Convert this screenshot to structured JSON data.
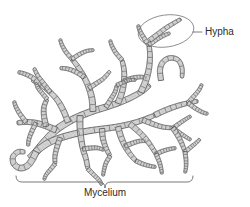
{
  "figure": {
    "background_color": "#ffffff",
    "width": 250,
    "height": 207
  },
  "labels": {
    "hypha": {
      "text": "Hypha",
      "x": 205,
      "y": 35,
      "anchor": "start",
      "color": "#2b2b2b",
      "font_size": 10
    },
    "mycelium": {
      "text": "Mycelium",
      "x": 105,
      "y": 196,
      "anchor": "middle",
      "color": "#2b2b2b",
      "font_size": 10
    }
  },
  "callout": {
    "name": "hypha-callout",
    "shape": "ellipse",
    "cx": 166,
    "cy": 31,
    "rx": 28,
    "ry": 16,
    "rotation": -8,
    "stroke_color": "#7a7a7a",
    "leader_from_x": 193,
    "leader_from_y": 32,
    "leader_to_x": 202,
    "leader_to_y": 32
  },
  "brace": {
    "name": "mycelium-brace",
    "left_x": 16,
    "right_x": 193,
    "top_y": 176,
    "baseline_y": 182,
    "notch_x": 105,
    "notch_y": 188,
    "stroke_color": "#6a6a6a"
  },
  "colors": {
    "hypha_fill": "#d4d4d4",
    "hypha_stipple": "#8e8e8e",
    "hypha_outline": "#5a5a5a",
    "septum": "#6a6a6a",
    "label": "#2b2b2b",
    "callout_stroke": "#7a7a7a",
    "background": "#ffffff"
  },
  "structure": {
    "description": "Branching network of septate hyphae forming a mycelium",
    "branch_count": 38,
    "septa_count": 96
  },
  "hyphae": [
    {
      "name": "trunk-main",
      "width": 7.0,
      "points": [
        [
          36,
          152
        ],
        [
          46,
          140
        ],
        [
          56,
          130
        ],
        [
          68,
          122
        ],
        [
          80,
          116
        ],
        [
          93,
          111
        ],
        [
          106,
          107
        ],
        [
          118,
          103
        ],
        [
          130,
          98
        ],
        [
          141,
          92
        ],
        [
          150,
          85
        ]
      ]
    },
    {
      "name": "trunk-lower",
      "width": 6.6,
      "points": [
        [
          30,
          158
        ],
        [
          38,
          150
        ],
        [
          48,
          143
        ],
        [
          60,
          138
        ],
        [
          74,
          134
        ],
        [
          88,
          131
        ],
        [
          102,
          129
        ],
        [
          116,
          127
        ],
        [
          130,
          124
        ],
        [
          143,
          120
        ],
        [
          155,
          115
        ]
      ]
    },
    {
      "name": "branch-upper-left",
      "width": 5.6,
      "points": [
        [
          68,
          122
        ],
        [
          64,
          112
        ],
        [
          58,
          101
        ],
        [
          50,
          92
        ],
        [
          41,
          85
        ],
        [
          32,
          80
        ]
      ]
    },
    {
      "name": "tip-upper-left-a",
      "width": 4.6,
      "points": [
        [
          41,
          85
        ],
        [
          33,
          78
        ],
        [
          25,
          74
        ],
        [
          18,
          72
        ]
      ]
    },
    {
      "name": "tip-upper-left-b",
      "width": 4.4,
      "points": [
        [
          50,
          92
        ],
        [
          44,
          84
        ],
        [
          38,
          76
        ],
        [
          34,
          68
        ]
      ]
    },
    {
      "name": "branch-up-center",
      "width": 6.0,
      "points": [
        [
          93,
          111
        ],
        [
          92,
          99
        ],
        [
          89,
          88
        ],
        [
          84,
          77
        ],
        [
          78,
          67
        ],
        [
          72,
          59
        ]
      ]
    },
    {
      "name": "tip-up-center-a",
      "width": 4.6,
      "points": [
        [
          84,
          77
        ],
        [
          76,
          72
        ],
        [
          68,
          69
        ],
        [
          60,
          68
        ]
      ]
    },
    {
      "name": "tip-up-center-b",
      "width": 4.4,
      "points": [
        [
          89,
          88
        ],
        [
          97,
          83
        ],
        [
          104,
          78
        ],
        [
          110,
          71
        ]
      ]
    },
    {
      "name": "tip-up-center-c",
      "width": 4.2,
      "points": [
        [
          72,
          59
        ],
        [
          66,
          52
        ],
        [
          62,
          45
        ],
        [
          60,
          39
        ]
      ]
    },
    {
      "name": "tip-up-center-d",
      "width": 4.0,
      "points": [
        [
          72,
          59
        ],
        [
          80,
          54
        ],
        [
          87,
          51
        ],
        [
          94,
          50
        ]
      ]
    },
    {
      "name": "branch-mid-right",
      "width": 5.8,
      "points": [
        [
          118,
          103
        ],
        [
          122,
          92
        ],
        [
          124,
          81
        ],
        [
          124,
          70
        ],
        [
          122,
          60
        ]
      ]
    },
    {
      "name": "tip-mid-right-a",
      "width": 4.4,
      "points": [
        [
          124,
          81
        ],
        [
          133,
          78
        ],
        [
          141,
          77
        ],
        [
          148,
          78
        ]
      ]
    },
    {
      "name": "tip-mid-right-b",
      "width": 4.2,
      "points": [
        [
          122,
          60
        ],
        [
          116,
          53
        ],
        [
          112,
          46
        ],
        [
          110,
          40
        ]
      ]
    },
    {
      "name": "branch-tall-right",
      "width": 6.0,
      "points": [
        [
          141,
          92
        ],
        [
          146,
          80
        ],
        [
          149,
          68
        ],
        [
          150,
          56
        ],
        [
          149,
          45
        ]
      ]
    },
    {
      "name": "tip-tall-right-a",
      "width": 4.4,
      "points": [
        [
          149,
          45
        ],
        [
          144,
          38
        ],
        [
          140,
          31
        ],
        [
          138,
          25
        ]
      ]
    },
    {
      "name": "tip-tall-right-b",
      "width": 4.2,
      "points": [
        [
          149,
          45
        ],
        [
          156,
          40
        ],
        [
          163,
          36
        ],
        [
          170,
          33
        ]
      ]
    },
    {
      "name": "hypha-highlighted",
      "width": 4.6,
      "points": [
        [
          150,
          40
        ],
        [
          158,
          34
        ],
        [
          166,
          28
        ],
        [
          174,
          23
        ],
        [
          181,
          19
        ]
      ]
    },
    {
      "name": "loop-hook",
      "width": 5.2,
      "points": [
        [
          161,
          80
        ],
        [
          160,
          70
        ],
        [
          163,
          62
        ],
        [
          170,
          58
        ],
        [
          178,
          60
        ],
        [
          182,
          68
        ],
        [
          182,
          78
        ]
      ]
    },
    {
      "name": "branch-right-arm",
      "width": 5.4,
      "points": [
        [
          155,
          115
        ],
        [
          166,
          110
        ],
        [
          177,
          106
        ],
        [
          188,
          103
        ],
        [
          198,
          101
        ]
      ]
    },
    {
      "name": "tip-right-arm-a",
      "width": 4.2,
      "points": [
        [
          188,
          103
        ],
        [
          194,
          96
        ],
        [
          199,
          90
        ],
        [
          202,
          84
        ]
      ]
    },
    {
      "name": "tip-right-arm-b",
      "width": 4.2,
      "points": [
        [
          188,
          103
        ],
        [
          195,
          108
        ],
        [
          202,
          112
        ],
        [
          208,
          114
        ]
      ]
    },
    {
      "name": "branch-right-mid",
      "width": 5.0,
      "points": [
        [
          143,
          120
        ],
        [
          153,
          124
        ],
        [
          163,
          127
        ],
        [
          173,
          128
        ]
      ]
    },
    {
      "name": "tip-right-mid-a",
      "width": 4.0,
      "points": [
        [
          173,
          128
        ],
        [
          180,
          123
        ],
        [
          186,
          119
        ],
        [
          191,
          116
        ]
      ]
    },
    {
      "name": "tip-right-mid-b",
      "width": 4.0,
      "points": [
        [
          173,
          128
        ],
        [
          180,
          133
        ],
        [
          186,
          137
        ],
        [
          191,
          140
        ]
      ]
    },
    {
      "name": "branch-left-arm",
      "width": 6.0,
      "points": [
        [
          56,
          130
        ],
        [
          46,
          126
        ],
        [
          36,
          123
        ],
        [
          26,
          122
        ],
        [
          17,
          123
        ]
      ]
    },
    {
      "name": "tip-left-arm-a",
      "width": 4.4,
      "points": [
        [
          26,
          122
        ],
        [
          20,
          114
        ],
        [
          16,
          107
        ],
        [
          14,
          101
        ]
      ]
    },
    {
      "name": "tip-left-arm-b",
      "width": 4.4,
      "points": [
        [
          36,
          123
        ],
        [
          32,
          131
        ],
        [
          29,
          139
        ],
        [
          28,
          146
        ]
      ]
    },
    {
      "name": "branch-left-up",
      "width": 5.4,
      "points": [
        [
          46,
          126
        ],
        [
          44,
          116
        ],
        [
          44,
          107
        ],
        [
          47,
          99
        ]
      ]
    },
    {
      "name": "tip-left-up-a",
      "width": 4.2,
      "points": [
        [
          47,
          99
        ],
        [
          42,
          93
        ],
        [
          38,
          88
        ],
        [
          36,
          83
        ]
      ]
    },
    {
      "name": "hook-bottom-left",
      "width": 6.2,
      "points": [
        [
          36,
          152
        ],
        [
          32,
          160
        ],
        [
          27,
          166
        ],
        [
          20,
          168
        ],
        [
          14,
          164
        ],
        [
          13,
          157
        ],
        [
          18,
          152
        ],
        [
          25,
          152
        ]
      ]
    },
    {
      "name": "branch-down-center",
      "width": 6.0,
      "points": [
        [
          80,
          116
        ],
        [
          80,
          127
        ],
        [
          81,
          138
        ],
        [
          83,
          149
        ],
        [
          86,
          159
        ],
        [
          88,
          169
        ]
      ]
    },
    {
      "name": "tip-down-center-a",
      "width": 4.4,
      "points": [
        [
          83,
          149
        ],
        [
          91,
          148
        ],
        [
          98,
          148
        ],
        [
          104,
          150
        ]
      ]
    },
    {
      "name": "tip-down-center-b",
      "width": 4.2,
      "points": [
        [
          88,
          169
        ],
        [
          94,
          175
        ],
        [
          99,
          180
        ],
        [
          102,
          185
        ]
      ]
    },
    {
      "name": "branch-down-right",
      "width": 5.8,
      "points": [
        [
          118,
          127
        ],
        [
          121,
          137
        ],
        [
          125,
          146
        ],
        [
          130,
          154
        ],
        [
          136,
          161
        ]
      ]
    },
    {
      "name": "tip-down-right-a",
      "width": 4.4,
      "points": [
        [
          125,
          146
        ],
        [
          133,
          143
        ],
        [
          140,
          141
        ],
        [
          147,
          141
        ]
      ]
    },
    {
      "name": "tip-down-right-b",
      "width": 4.2,
      "points": [
        [
          136,
          161
        ],
        [
          143,
          164
        ],
        [
          150,
          166
        ],
        [
          156,
          167
        ]
      ]
    },
    {
      "name": "branch-low-center",
      "width": 5.4,
      "points": [
        [
          102,
          129
        ],
        [
          103,
          139
        ],
        [
          106,
          148
        ],
        [
          110,
          156
        ]
      ]
    },
    {
      "name": "tip-low-center-a",
      "width": 4.0,
      "points": [
        [
          110,
          156
        ],
        [
          106,
          163
        ],
        [
          104,
          170
        ],
        [
          103,
          176
        ]
      ]
    },
    {
      "name": "branch-low-right",
      "width": 5.4,
      "points": [
        [
          130,
          124
        ],
        [
          138,
          131
        ],
        [
          145,
          138
        ],
        [
          151,
          146
        ],
        [
          156,
          154
        ]
      ]
    },
    {
      "name": "tip-low-right-a",
      "width": 4.2,
      "points": [
        [
          156,
          154
        ],
        [
          163,
          151
        ],
        [
          170,
          149
        ],
        [
          176,
          148
        ]
      ]
    },
    {
      "name": "tip-low-right-b",
      "width": 4.2,
      "points": [
        [
          156,
          154
        ],
        [
          159,
          161
        ],
        [
          161,
          168
        ],
        [
          162,
          174
        ]
      ]
    },
    {
      "name": "branch-far-right-low",
      "width": 5.0,
      "points": [
        [
          173,
          128
        ],
        [
          178,
          136
        ],
        [
          182,
          144
        ],
        [
          185,
          152
        ]
      ]
    },
    {
      "name": "tip-far-right-low-a",
      "width": 4.0,
      "points": [
        [
          185,
          152
        ],
        [
          191,
          147
        ],
        [
          196,
          143
        ],
        [
          200,
          139
        ]
      ]
    },
    {
      "name": "tip-far-right-low-b",
      "width": 4.0,
      "points": [
        [
          185,
          152
        ],
        [
          186,
          160
        ],
        [
          186,
          167
        ],
        [
          185,
          173
        ]
      ]
    },
    {
      "name": "branch-mid-down-left",
      "width": 5.0,
      "points": [
        [
          60,
          138
        ],
        [
          57,
          147
        ],
        [
          55,
          156
        ],
        [
          55,
          164
        ]
      ]
    },
    {
      "name": "tip-mid-down-left-a",
      "width": 4.0,
      "points": [
        [
          55,
          164
        ],
        [
          50,
          170
        ],
        [
          46,
          175
        ],
        [
          44,
          180
        ]
      ]
    },
    {
      "name": "branch-short-center",
      "width": 4.6,
      "points": [
        [
          106,
          107
        ],
        [
          111,
          99
        ],
        [
          115,
          92
        ],
        [
          117,
          85
        ]
      ]
    },
    {
      "name": "tip-short-center-a",
      "width": 3.8,
      "points": [
        [
          117,
          85
        ],
        [
          124,
          82
        ],
        [
          130,
          80
        ],
        [
          136,
          80
        ]
      ]
    }
  ]
}
